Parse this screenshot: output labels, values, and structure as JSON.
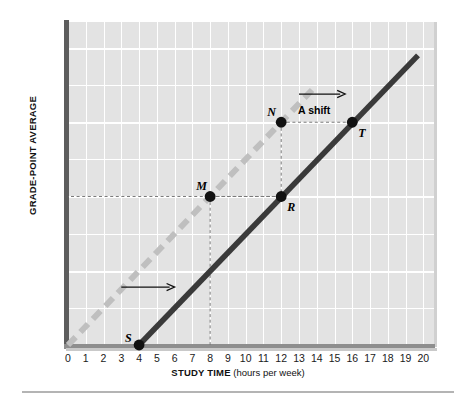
{
  "chart_data": {
    "type": "line",
    "title": "",
    "xlabel": "STUDY TIME (hours per week)",
    "xlabel_bold": "STUDY TIME",
    "xlabel_unit": "(hours per week)",
    "ylabel": "GRADE-POINT AVERAGE",
    "xlim": [
      0,
      20.6
    ],
    "ylim": [
      0,
      4.35
    ],
    "grid": true,
    "legend": "none",
    "x_ticks": [
      "0",
      "1",
      "2",
      "3",
      "4",
      "5",
      "6",
      "7",
      "8",
      "9",
      "10",
      "11",
      "12",
      "13",
      "14",
      "15",
      "16",
      "17",
      "18",
      "19",
      "20"
    ],
    "x_tick_values": [
      0,
      1,
      2,
      3,
      4,
      5,
      6,
      7,
      8,
      9,
      10,
      11,
      12,
      13,
      14,
      15,
      16,
      17,
      18,
      19,
      20
    ],
    "y_ticks": [
      {
        "value": 4.0,
        "label": "4.0",
        "grade": "(= A)"
      },
      {
        "value": 3.5,
        "label": "3.5",
        "grade": ""
      },
      {
        "value": 3.0,
        "label": "3.0",
        "grade": "(= B)"
      },
      {
        "value": 2.5,
        "label": "2.5",
        "grade": ""
      },
      {
        "value": 2.0,
        "label": "2.0",
        "grade": "(= C)"
      },
      {
        "value": 1.5,
        "label": "1.5",
        "grade": ""
      },
      {
        "value": 1.0,
        "label": "1.0",
        "grade": "(= D)"
      },
      {
        "value": 0.5,
        "label": "0.5",
        "grade": ""
      },
      {
        "value": 0.0,
        "label": "0",
        "grade": "(= F)"
      }
    ],
    "series": [
      {
        "name": "original-line",
        "style": "dashed",
        "color": "#bfbfbf",
        "x": [
          0,
          14.0
        ],
        "y": [
          0,
          3.5
        ]
      },
      {
        "name": "shifted-line",
        "style": "solid",
        "color": "#3a3a3a",
        "x": [
          4.0,
          19.7
        ],
        "y": [
          0,
          3.9
        ]
      }
    ],
    "points": [
      {
        "label": "S",
        "x": 4,
        "y": 0.0,
        "label_dx": -14,
        "label_dy": -14
      },
      {
        "label": "M",
        "x": 8,
        "y": 2.0,
        "label_dx": -14,
        "label_dy": -17
      },
      {
        "label": "N",
        "x": 12,
        "y": 3.0,
        "label_dx": -14,
        "label_dy": -17
      },
      {
        "label": "R",
        "x": 12,
        "y": 2.0,
        "label_dx": 6,
        "label_dy": 4
      },
      {
        "label": "T",
        "x": 16,
        "y": 3.0,
        "label_dx": 6,
        "label_dy": 4
      }
    ],
    "connectors": [
      {
        "name": "m-to-axis",
        "from": [
          8,
          2.0
        ],
        "to": [
          8,
          0.0
        ]
      },
      {
        "name": "m-to-r",
        "from": [
          8,
          2.0
        ],
        "to": [
          12,
          2.0
        ]
      },
      {
        "name": "n-to-r",
        "from": [
          12,
          3.0
        ],
        "to": [
          12,
          2.0
        ]
      },
      {
        "name": "n-to-t",
        "from": [
          12,
          3.0
        ],
        "to": [
          16,
          3.0
        ]
      },
      {
        "name": "r-to-yaxis",
        "from": [
          12,
          2.0
        ],
        "to": [
          0,
          2.0
        ]
      }
    ],
    "annotations": [
      {
        "name": "lower-shift-arrow",
        "text": "",
        "x_start": 3.0,
        "x_end": 6.0,
        "y": 0.78
      },
      {
        "name": "a-shift-arrow",
        "text": "A shift",
        "x_start": 13.0,
        "x_end": 15.6,
        "y": 3.38,
        "text_x": 14.3,
        "text_y": 3.17
      }
    ]
  },
  "colors": {
    "plot_background": "#e3e3e3",
    "gridline": "#ffffff",
    "axis": "#5d5d5d",
    "original_line": "#bfbfbf",
    "shifted_line": "#3a3a3a",
    "point": "#111111",
    "connector": "#7a7a7a",
    "text": "#111111"
  }
}
